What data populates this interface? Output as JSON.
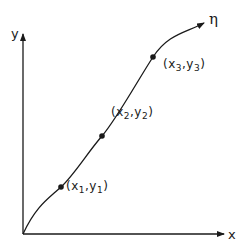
{
  "axes": {
    "x_label": "x",
    "y_label": "y"
  },
  "curve": {
    "label": "η"
  },
  "points": [
    {
      "id": "p1",
      "open": "(",
      "x_var": "x",
      "x_sub": "1",
      "sep": ",",
      "y_var": "y",
      "y_sub": "1",
      "close": ")"
    },
    {
      "id": "p2",
      "open": "(",
      "x_var": "x",
      "x_sub": "2",
      "sep": ",",
      "y_var": "y",
      "y_sub": "2",
      "close": ")"
    },
    {
      "id": "p3",
      "open": "(",
      "x_var": "x",
      "x_sub": "3",
      "sep": ",",
      "y_var": "y",
      "y_sub": "3",
      "close": ")"
    }
  ],
  "colors": {
    "ink": "#1a1a1a",
    "background": "#ffffff"
  }
}
